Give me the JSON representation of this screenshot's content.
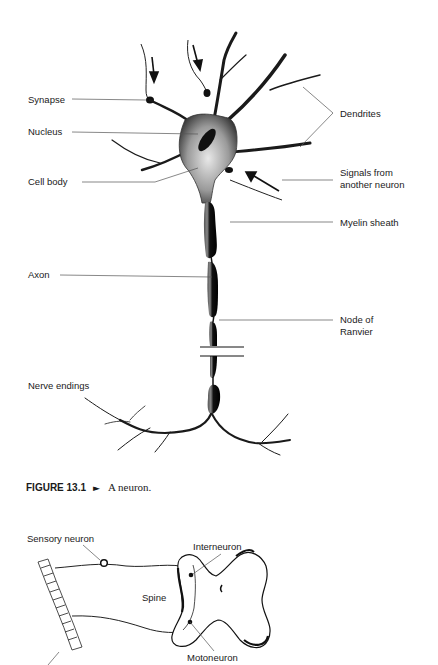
{
  "figure1": {
    "labels": {
      "synapse": "Synapse",
      "nucleus": "Nucleus",
      "cell_body": "Cell body",
      "dendrites": "Dendrites",
      "signals_line1": "Signals from",
      "signals_line2": "another neuron",
      "myelin_sheath": "Myelin sheath",
      "axon": "Axon",
      "node_line1": "Node of",
      "node_line2": "Ranvier",
      "nerve_endings": "Nerve endings"
    },
    "caption": {
      "figure_number": "FIGURE 13.1",
      "arrow": "►",
      "text": "A neuron."
    }
  },
  "figure2": {
    "labels": {
      "sensory_neuron": "Sensory neuron",
      "interneuron": "Interneuron",
      "spine": "Spine",
      "motoneuron": "Motoneuron"
    }
  },
  "colors": {
    "ink": "#1a1a1a",
    "leader_line": "#555555",
    "background": "#ffffff"
  }
}
